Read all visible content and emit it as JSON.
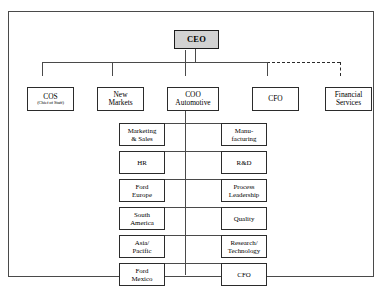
{
  "diagram": {
    "type": "organization-chart",
    "root": {
      "id": "ceo",
      "label": "CEO",
      "fill": "#d2d2d2"
    },
    "level1": [
      {
        "id": "cos",
        "label": "COS",
        "sublabel": "(Chief of Staff)",
        "link": "solid"
      },
      {
        "id": "new-markets",
        "label_line1": "New",
        "label_line2": "Markets",
        "link": "solid"
      },
      {
        "id": "coo-automotive",
        "label_line1": "COO",
        "label_line2": "Automotive",
        "link": "solid"
      },
      {
        "id": "cfo",
        "label": "CFO",
        "link": "solid"
      },
      {
        "id": "financial-services",
        "label_line1": "Financial",
        "label_line2": "Services",
        "link": "dashed"
      }
    ],
    "coo_reports_left": [
      {
        "id": "marketing-sales",
        "line1": "Marketing",
        "line2": "& Sales"
      },
      {
        "id": "hr",
        "line1": "HR",
        "line2": ""
      },
      {
        "id": "ford-europe",
        "line1": "Ford",
        "line2": "Europe"
      },
      {
        "id": "south-america",
        "line1": "South",
        "line2": "America"
      },
      {
        "id": "asia-pacific",
        "line1": "Asia/",
        "line2": "Pacific"
      },
      {
        "id": "ford-mexico",
        "line1": "Ford",
        "line2": "Mexico"
      }
    ],
    "coo_reports_right": [
      {
        "id": "manufacturing",
        "line1": "Manu-",
        "line2": "facturing"
      },
      {
        "id": "rd",
        "line1": "R&D",
        "line2": ""
      },
      {
        "id": "process-leadership",
        "line1": "Process",
        "line2": "Leadership"
      },
      {
        "id": "quality",
        "line1": "Quality",
        "line2": ""
      },
      {
        "id": "research-technology",
        "line1": "Research/",
        "line2": "Technology"
      },
      {
        "id": "cfo-automotive",
        "line1": "CFO",
        "line2": ""
      }
    ],
    "colors": {
      "root_fill": "#d2d2d2",
      "box_border": "#2b2b2b",
      "connector": "#4a4a4a",
      "frame_border": "#4a4a4a",
      "background": "#ffffff"
    }
  }
}
